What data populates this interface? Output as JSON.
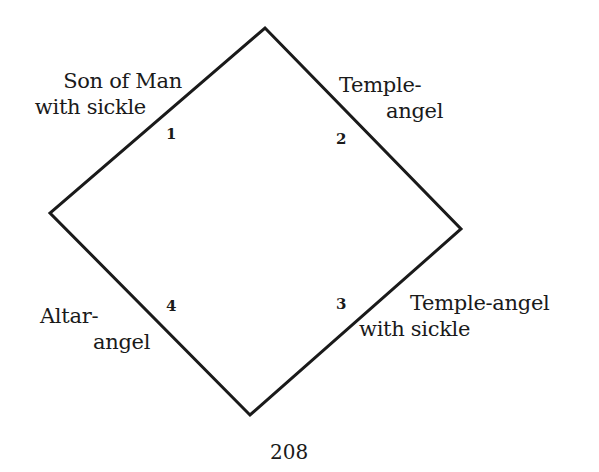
{
  "diagram": {
    "shape": "diamond",
    "stroke_color": "#1a1a1a",
    "vertices": {
      "top": [
        265,
        28
      ],
      "right": [
        461,
        229
      ],
      "bottom": [
        250,
        415
      ],
      "left": [
        50,
        213
      ]
    },
    "corners": [
      {
        "number": "1",
        "label_line1": "Son of Man",
        "label_line2": "with sickle"
      },
      {
        "number": "2",
        "label_line1": "Temple-",
        "label_line2": "angel"
      },
      {
        "number": "3",
        "label_line1": "Temple-angel",
        "label_line2": "with sickle"
      },
      {
        "number": "4",
        "label_line1": "Altar-",
        "label_line2": "angel"
      }
    ]
  },
  "page_number": "208"
}
